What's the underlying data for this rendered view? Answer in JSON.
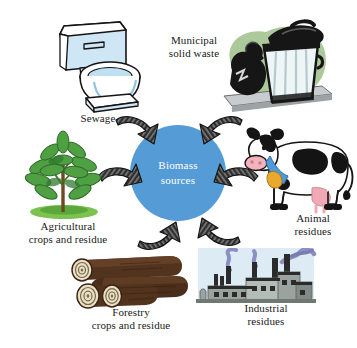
{
  "diagram": {
    "title": "Biomass sources",
    "type": "radial-hub-and-spoke",
    "background_color": "#ffffff",
    "hub": {
      "label": "Biomass\nsources",
      "fill_color": "#559bd6",
      "text_color": "#ffffff",
      "shape": "circle"
    },
    "arrow_color": "#2b2b2b",
    "arrow_direction": "inward-toward-hub",
    "arrow_count": 6,
    "nodes": [
      {
        "id": "sewage",
        "label": "Sewage",
        "icon": "toilet-icon",
        "position": "top-left",
        "colors": {
          "outline": "#1a1a1a",
          "fill": "#cfe6f5",
          "highlight": "#ffffff"
        }
      },
      {
        "id": "municipal-solid-waste",
        "label": "Municipal\nsolid waste",
        "icon": "trash-can-icon",
        "position": "top-right",
        "colors": {
          "can": "#eef5f7",
          "lid": "#141414",
          "bags": "#141414",
          "backdrop": "#9cc08a",
          "ground": "#c9ccce"
        }
      },
      {
        "id": "agricultural-crops-and-residue",
        "label": "Agricultural\ncrops and residue",
        "icon": "plant-icon",
        "position": "left",
        "colors": {
          "leaf": "#4f9f43",
          "leaf_dark": "#2f7a30",
          "stem": "#6b4a22",
          "ground": "#7cc24f"
        }
      },
      {
        "id": "animal-residues",
        "label": "Animal\nresidues",
        "icon": "cow-icon",
        "position": "right",
        "colors": {
          "body": "#ffffff",
          "patches": "#141414",
          "snout": "#f2b3bd",
          "udder": "#f2a9b6",
          "collar": "#4f9ad8",
          "bell": "#e8a92e"
        }
      },
      {
        "id": "forestry-crops-and-residue",
        "label": "Forestry\ncrops and residue",
        "icon": "logs-icon",
        "position": "bottom-left",
        "colors": {
          "bark": "#51331e",
          "bark_dark": "#3b2414",
          "rings": "#e8e0c8",
          "ring_line": "#6b5a3a"
        }
      },
      {
        "id": "industrial-residues",
        "label": "Industrial\nresidues",
        "icon": "factory-icon",
        "position": "bottom-right",
        "colors": {
          "building": "#9aa3a0",
          "building_dark": "#6f7873",
          "roof": "#2b2b2b",
          "smoke": "#8d8fc4",
          "sky": "#d6e7f2"
        }
      }
    ]
  }
}
